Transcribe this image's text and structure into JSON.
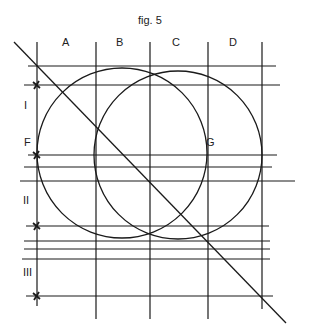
{
  "figure": {
    "title": "fig. 5",
    "stroke_color": "#1a1a1a",
    "background": "#ffffff"
  },
  "column_labels": [
    {
      "text": "A",
      "x": 62,
      "y": 37
    },
    {
      "text": "B",
      "x": 116,
      "y": 37
    },
    {
      "text": "C",
      "x": 172,
      "y": 37
    },
    {
      "text": "D",
      "x": 229,
      "y": 37
    }
  ],
  "row_labels": [
    {
      "text": "I",
      "x": 24,
      "y": 100
    },
    {
      "text": "II",
      "x": 23,
      "y": 195
    },
    {
      "text": "III",
      "x": 23,
      "y": 267
    }
  ],
  "point_labels": [
    {
      "text": "F",
      "x": 24,
      "y": 137
    },
    {
      "text": "G",
      "x": 206,
      "y": 137
    }
  ],
  "vertical_lines": [
    {
      "x": 37,
      "y1": 42,
      "y2": 306
    },
    {
      "x": 96,
      "y1": 42,
      "y2": 319
    },
    {
      "x": 150,
      "y1": 42,
      "y2": 319
    },
    {
      "x": 208,
      "y1": 42,
      "y2": 319
    },
    {
      "x": 262,
      "y1": 42,
      "y2": 309
    }
  ],
  "horizontal_lines": [
    {
      "y": 66,
      "x1": 28,
      "x2": 276
    },
    {
      "y": 85,
      "x1": 24,
      "x2": 280
    },
    {
      "y": 155,
      "x1": 28,
      "x2": 277
    },
    {
      "y": 167,
      "x1": 24,
      "x2": 272
    },
    {
      "y": 181,
      "x1": 20,
      "x2": 295
    },
    {
      "y": 226,
      "x1": 26,
      "x2": 269
    },
    {
      "y": 241,
      "x1": 24,
      "x2": 270
    },
    {
      "y": 249,
      "x1": 24,
      "x2": 270
    },
    {
      "y": 259,
      "x1": 22,
      "x2": 270
    },
    {
      "y": 296,
      "x1": 26,
      "x2": 273
    }
  ],
  "circles": [
    {
      "name": "left-circle",
      "cx": 122,
      "cy": 153,
      "r": 85
    },
    {
      "name": "right-circle",
      "cx": 178,
      "cy": 155,
      "r": 84
    }
  ],
  "diagonal": {
    "x1": 14,
    "y1": 42,
    "x2": 286,
    "y2": 323
  },
  "markers": [
    {
      "x": 37,
      "y": 85
    },
    {
      "x": 37,
      "y": 155
    },
    {
      "x": 37,
      "y": 226
    },
    {
      "x": 37,
      "y": 296
    }
  ]
}
